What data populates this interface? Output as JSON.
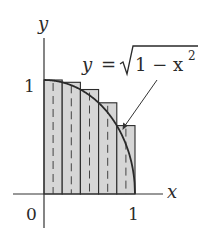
{
  "figure": {
    "type": "riemann_sum_diagram",
    "function_label": {
      "lhs": "y",
      "eq": "=",
      "radicand": "1 − x",
      "exponent": "2"
    },
    "axes": {
      "x_label": "x",
      "y_label": "y",
      "origin_label": "0",
      "x_tick_label": "1",
      "y_tick_label": "1"
    },
    "colors": {
      "axis": "#333333",
      "rect_fill": "#d6d6d6",
      "rect_stroke": "#2a2a2a",
      "curve": "#2a2a2a",
      "dash": "#444444"
    },
    "rectangles": [
      {
        "x0": 0.0,
        "x1": 0.2,
        "height": 1.0
      },
      {
        "x0": 0.2,
        "x1": 0.4,
        "height": 0.9798
      },
      {
        "x0": 0.4,
        "x1": 0.6,
        "height": 0.9165
      },
      {
        "x0": 0.6,
        "x1": 0.8,
        "height": 0.8
      },
      {
        "x0": 0.8,
        "x1": 1.0,
        "height": 0.6
      }
    ],
    "n_subintervals": 5
  }
}
